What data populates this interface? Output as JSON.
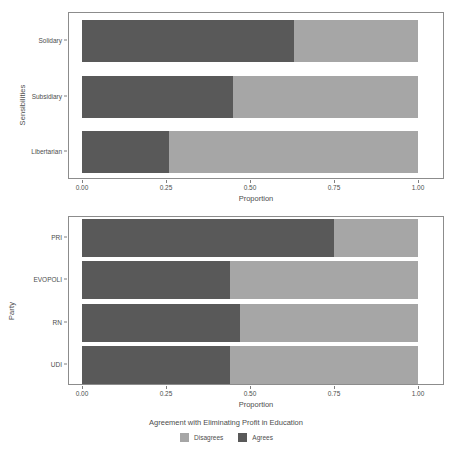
{
  "chart_data": [
    {
      "type": "bar",
      "orientation": "horizontal",
      "stacked": true,
      "normalized": true,
      "panel": "top",
      "title": "",
      "xlabel": "Proportion",
      "ylabel": "Sensibilities",
      "xlim": [
        0,
        1
      ],
      "xticks": [
        0,
        0.25,
        0.5,
        0.75,
        1
      ],
      "xtick_labels": [
        "0.00",
        "0.25",
        "0.50",
        "0.75",
        "1.00"
      ],
      "grid": false,
      "categories": [
        "Solidary",
        "Subsidiary",
        "Libertarian"
      ],
      "series": [
        {
          "name": "Agrees",
          "color": "#595959",
          "values": [
            0.63,
            0.45,
            0.26
          ]
        },
        {
          "name": "Disagrees",
          "color": "#a6a6a6",
          "values": [
            0.37,
            0.55,
            0.74
          ]
        }
      ]
    },
    {
      "type": "bar",
      "orientation": "horizontal",
      "stacked": true,
      "normalized": true,
      "panel": "bottom",
      "title": "",
      "xlabel": "Proportion",
      "ylabel": "Party",
      "xlim": [
        0,
        1
      ],
      "xticks": [
        0,
        0.25,
        0.5,
        0.75,
        1
      ],
      "xtick_labels": [
        "0.00",
        "0.25",
        "0.50",
        "0.75",
        "1.00"
      ],
      "grid": false,
      "categories": [
        "PRI",
        "EVOPOLI",
        "RN",
        "UDI"
      ],
      "series": [
        {
          "name": "Agrees",
          "color": "#595959",
          "values": [
            0.75,
            0.44,
            0.47,
            0.44
          ]
        },
        {
          "name": "Disagrees",
          "color": "#a6a6a6",
          "values": [
            0.25,
            0.56,
            0.53,
            0.56
          ]
        }
      ]
    }
  ],
  "legend": {
    "title": "Agreement with Eliminating Profit in Education",
    "position": "bottom",
    "items": [
      {
        "label": "Disagrees",
        "color": "#a6a6a6"
      },
      {
        "label": "Agrees",
        "color": "#595959"
      }
    ]
  },
  "colors": {
    "agrees": "#595959",
    "disagrees": "#a6a6a6",
    "panel_border": "#8c8c8c",
    "text": "#4d4d4d",
    "background": "#ffffff"
  }
}
